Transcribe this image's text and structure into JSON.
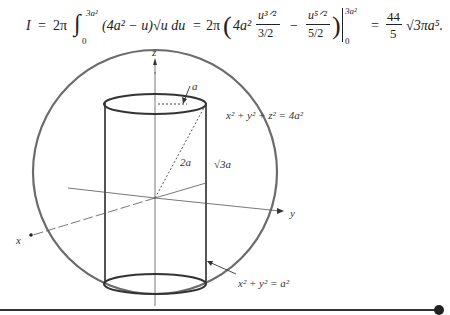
{
  "equation": {
    "lhs": "I",
    "eq1": "=",
    "coef1": "2π",
    "integral_sign": "∫",
    "upper_limit": "3a²",
    "lower_limit": "0",
    "integrand": "(4a² − u)√u du",
    "eq2": "=",
    "coef2": "2π",
    "bracket_content_term1_coef": "4a²",
    "term1_num": "u³ᐟ²",
    "term1_den": "3/2",
    "minus": "−",
    "term2_num": "u⁵ᐟ²",
    "term2_den": "5/2",
    "eval_upper": "3a²",
    "eval_lower": "0",
    "eq3": "=",
    "result_num": "44",
    "result_den": "5",
    "result_tail": "√3πa⁵."
  },
  "figure": {
    "axis_labels": {
      "z": "z",
      "y": "y",
      "x": "x"
    },
    "annotations": {
      "radius": "a",
      "diagonal": "2a",
      "half_height": "√3a",
      "sphere_eq": "x² + y² + z² = 4a²",
      "cylinder_eq": "x² + y² = a²"
    },
    "colors": {
      "sphere": "#6b6b6b",
      "cylinder": "#555555",
      "axes": "#444444",
      "rule": "#333333"
    }
  }
}
